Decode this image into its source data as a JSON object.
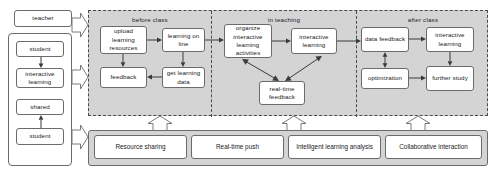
{
  "diagram": {
    "colors": {
      "stage_fill": "#d4d4d4",
      "node_fill": "#ffffff",
      "border": "#6b6b6b",
      "dashed_border": "#4a4a4a",
      "arrow": "#3a3a3a"
    }
  },
  "actors": {
    "teacher": {
      "label": "teacher"
    },
    "group": [
      {
        "label": "student"
      },
      {
        "label": "interactive\nlearning"
      },
      {
        "label": "shared"
      },
      {
        "label": "student"
      }
    ],
    "student_label": "student",
    "interactive_learning_label": "interactive learning",
    "shared_label": "shared"
  },
  "phases": [
    {
      "id": "before-class",
      "label": "before class",
      "nodes": [
        {
          "id": "upload-learning-resources",
          "label": "upload learning resources"
        },
        {
          "id": "learning-on-line",
          "label": "learning on line"
        },
        {
          "id": "feedback",
          "label": "feedback"
        },
        {
          "id": "get-learning-data",
          "label": "get learning data"
        }
      ]
    },
    {
      "id": "in-teaching",
      "label": "in teaching",
      "nodes": [
        {
          "id": "organize-interactive-learning-activities",
          "label": "organize interactive learning activities"
        },
        {
          "id": "interactive-learning",
          "label": "interactive learning"
        },
        {
          "id": "real-time-feedback",
          "label": "real-time feedback"
        }
      ]
    },
    {
      "id": "after-class",
      "label": "after class",
      "nodes": [
        {
          "id": "data-feedback",
          "label": "data feedback"
        },
        {
          "id": "interactive-learning",
          "label": "interactive learning"
        },
        {
          "id": "optimization",
          "label": "optimization"
        },
        {
          "id": "further-study",
          "label": "further study"
        }
      ]
    }
  ],
  "services": {
    "items": [
      {
        "id": "resource-sharing",
        "label": "Resource sharing"
      },
      {
        "id": "real-time-push",
        "label": "Real-time push"
      },
      {
        "id": "intelligent-learning-analysis",
        "label": "Intelligent learning analysis"
      },
      {
        "id": "collaborative-interaction",
        "label": "Collaborative interaction"
      }
    ]
  },
  "nodes": {
    "upload_learning_resources": "upload learning resources",
    "learning_on_line": "learning on line",
    "feedback": "feedback",
    "get_learning_data": "get learning data",
    "organize_interactive_learning_activities": "organize interactive learning activities",
    "interactive_learning_mid": "interactive learning",
    "real_time_feedback": "real-time feedback",
    "data_feedback": "data feedback",
    "interactive_learning_after": "interactive learning",
    "optimization": "optimization",
    "further_study": "further study"
  },
  "labels": {
    "before_class": "before class",
    "in_teaching": "in teaching",
    "after_class": "after class"
  }
}
